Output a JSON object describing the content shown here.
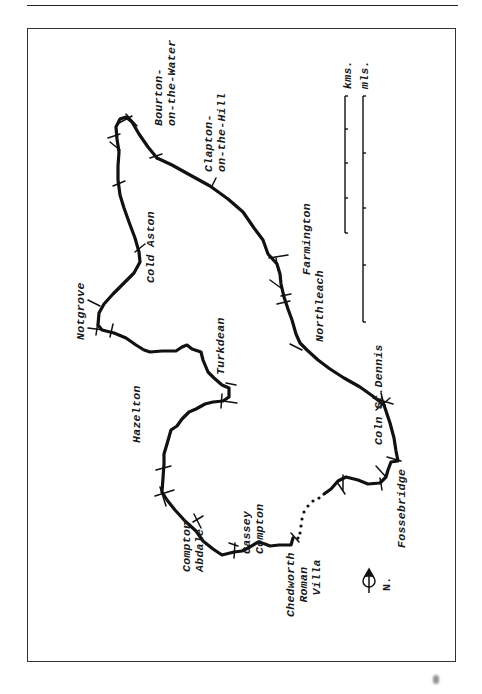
{
  "map": {
    "title": "",
    "places": [
      {
        "id": "bourton",
        "label": "Bourton-\non-the-Water",
        "x": 152,
        "y": 126
      },
      {
        "id": "clapton",
        "label": "Clapton-\non-the-Hill",
        "x": 202,
        "y": 172
      },
      {
        "id": "cold-aston",
        "label": "Cold Aston",
        "x": 144,
        "y": 283
      },
      {
        "id": "farmington",
        "label": "Farmington",
        "x": 300,
        "y": 275
      },
      {
        "id": "northleach",
        "label": "Northleach",
        "x": 313,
        "y": 342
      },
      {
        "id": "notgrove",
        "label": "Notgrove",
        "x": 74,
        "y": 340
      },
      {
        "id": "turkdean",
        "label": "Turkdean",
        "x": 214,
        "y": 375
      },
      {
        "id": "hazelton",
        "label": "Hazelton",
        "x": 130,
        "y": 443
      },
      {
        "id": "coln-st-dennis",
        "label": "Coln St.Dennis",
        "x": 372,
        "y": 445
      },
      {
        "id": "fossebridge",
        "label": "Fossebridge",
        "x": 395,
        "y": 548
      },
      {
        "id": "cassey-compton",
        "label": "Cassey\nCompton",
        "x": 240,
        "y": 554
      },
      {
        "id": "compton-abdale",
        "label": "Compton\nAbdale",
        "x": 180,
        "y": 572
      },
      {
        "id": "chedworth-roman-villa",
        "label": "Chedworth\n  Roman\n   Villa",
        "x": 284,
        "y": 617
      }
    ],
    "north_label": "N.",
    "scale": {
      "kms_label": "kms.",
      "mls_label": "mls."
    }
  }
}
